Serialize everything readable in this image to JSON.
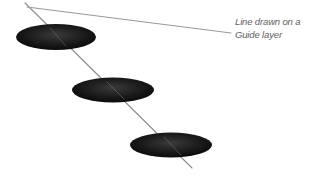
{
  "figure": {
    "background_color": "#ffffff",
    "width": 315,
    "height": 177
  },
  "annotation": {
    "line1": "Line drawn on a",
    "line2": "Guide layer",
    "text_color": "#5e5e5e",
    "style": "italic"
  },
  "graphics": {
    "line_color": "#8c8c8c",
    "line_width": 1.1,
    "ellipse_fill_dark": "#0d0d0d",
    "ellipse_fill_light": "#3a3a3a",
    "drawn_line": {
      "name": "drawn-line",
      "start": {
        "x": 25,
        "y": 3
      },
      "end": {
        "x": 192,
        "y": 168
      }
    },
    "leader_line": {
      "name": "leader-line",
      "start": {
        "x": 27,
        "y": 7
      },
      "end": {
        "x": 231,
        "y": 33
      }
    },
    "ellipses": [
      {
        "name": "ellipse-top",
        "cx": 56,
        "cy": 37,
        "rx": 40,
        "ry": 13
      },
      {
        "name": "ellipse-middle",
        "cx": 113,
        "cy": 90,
        "rx": 41,
        "ry": 12.5
      },
      {
        "name": "ellipse-bottom",
        "cx": 171,
        "cy": 145,
        "rx": 41,
        "ry": 12.5
      }
    ]
  }
}
